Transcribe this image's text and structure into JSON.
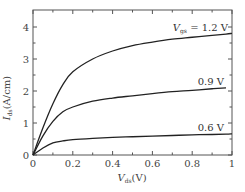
{
  "chart_data": {
    "type": "line",
    "title": "",
    "xlabel": "V_ds (V)",
    "ylabel": "I_ds (A/cm)",
    "xlim": [
      0,
      1
    ],
    "ylim": [
      0,
      4.5
    ],
    "grid": false,
    "legend": "inline labels at right end of curves",
    "x_ticks": [
      "0",
      "0.2",
      "0.4",
      "0.6",
      "0.8",
      "1"
    ],
    "y_ticks": [
      "0",
      "1",
      "2",
      "3",
      "4"
    ],
    "x": [
      0,
      0.05,
      0.1,
      0.15,
      0.2,
      0.3,
      0.4,
      0.5,
      0.6,
      0.7,
      0.8,
      0.9,
      0.97,
      1.0
    ],
    "series": [
      {
        "name": "V_gs = 1.2 V",
        "label_main": "V",
        "label_sub": "gs",
        "label_rest": " = 1.2 V",
        "values": [
          0,
          0.85,
          1.6,
          2.2,
          2.6,
          3.0,
          3.25,
          3.42,
          3.53,
          3.62,
          3.68,
          3.74,
          3.78,
          3.8
        ]
      },
      {
        "name": "0.9 V",
        "label_main": "0.9 V",
        "values": [
          0,
          0.6,
          1.05,
          1.35,
          1.5,
          1.68,
          1.78,
          1.85,
          1.92,
          1.98,
          2.02,
          2.07,
          2.1,
          null
        ]
      },
      {
        "name": "0.6 V",
        "label_main": "0.6 V",
        "values": [
          0,
          0.22,
          0.38,
          0.44,
          0.48,
          0.52,
          0.55,
          0.57,
          0.59,
          0.61,
          0.63,
          0.64,
          0.65,
          0.66
        ]
      }
    ]
  }
}
